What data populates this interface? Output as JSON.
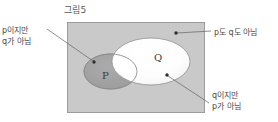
{
  "figure": {
    "title": "그림5",
    "type": "venn-diagram"
  },
  "universe": {
    "name": "universal-set-rectangle",
    "fill": "#c9c9c9",
    "stroke": "#9a9a9a",
    "x": 67,
    "y": 22,
    "width": 138,
    "height": 91
  },
  "sets": [
    {
      "id": "P",
      "label": "P",
      "fill": "#a3a3a3",
      "stroke": "#8a8a8a",
      "cx": 110.5,
      "cy": 71.5,
      "rx": 26.5,
      "ry": 17.5
    },
    {
      "id": "Q",
      "label": "Q",
      "fill": "#fbfbfb",
      "stroke": "#9a9a9a",
      "cx": 151,
      "cy": 61.5,
      "rx": 39,
      "ry": 23.5
    }
  ],
  "intersection": {
    "name": "p-and-q-region",
    "fill": "#ffffff"
  },
  "callouts": [
    {
      "id": "p-not-q",
      "lines": [
        "p이지만",
        "q가 아님"
      ],
      "line1": "p이지만",
      "line2": "q가 아님",
      "dot": {
        "x": 94,
        "y": 62
      },
      "leader": {
        "x1": 47,
        "y1": 29,
        "x2": 93,
        "y2": 61
      }
    },
    {
      "id": "neither-p-nor-q",
      "lines": [
        "p도 q도 아님"
      ],
      "line1": "p도 q도 아님",
      "dot": {
        "x": 176,
        "y": 33
      },
      "leader": {
        "x1": 211,
        "y1": 31,
        "x2": 177,
        "y2": 33
      }
    },
    {
      "id": "q-not-p",
      "lines": [
        "q이지만",
        "p가 아님"
      ],
      "line1": "q이지만",
      "line2": "p가 아님",
      "dot": {
        "x": 167,
        "y": 75
      },
      "leader": {
        "x1": 209,
        "y1": 103,
        "x2": 168,
        "y2": 76
      }
    }
  ],
  "colors": {
    "background": "#ffffff",
    "universe_fill": "#c9c9c9",
    "p_fill": "#a3a3a3",
    "q_fill": "#fbfbfb",
    "intersection_fill": "#ffffff",
    "outline": "#9a9a9a",
    "leader_line": "#6f6f6f",
    "text": "#4a4a4a"
  }
}
